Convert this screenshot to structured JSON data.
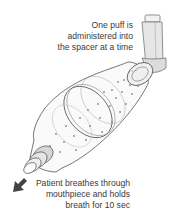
{
  "diagram": {
    "labels": {
      "top": {
        "lines": [
          "One puff is",
          "administered into",
          "the spacer at a time"
        ]
      },
      "bottom": {
        "lines": [
          "Patient breathes through",
          "mouthpiece and holds",
          "breath for 10 sec"
        ]
      }
    },
    "icons": {
      "inhaler": "inhaler-canister-icon",
      "spacer": "spacer-chamber-icon",
      "mouthpiece": "mouthpiece-icon",
      "arrow": "airflow-arrow-icon"
    },
    "colors": {
      "line": "#555555",
      "fill_light": "#f4f4f4",
      "fill_shade": "#d8d8d8",
      "arrow": "#444444",
      "dots": "#888888",
      "text": "#3a3a3a"
    }
  }
}
